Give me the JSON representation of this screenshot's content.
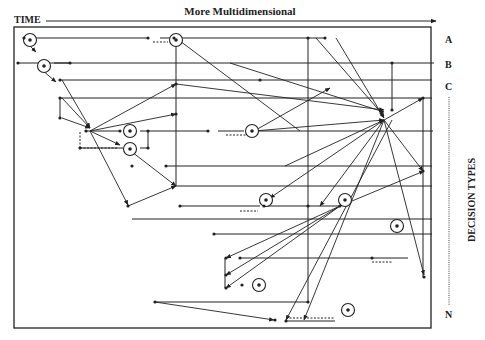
{
  "header": {
    "time_label": "TIME",
    "axis_label": "More Multidimensional"
  },
  "side": {
    "rows": [
      "A",
      "B",
      "C",
      "N"
    ],
    "axis_label": "DECISION TYPES"
  },
  "colors": {
    "ink": "#222222",
    "background": "#ffffff"
  },
  "frame": {
    "x": 14,
    "y": 27,
    "w": 417,
    "h": 301
  },
  "lines": [
    [
      24,
      38,
      148,
      38
    ],
    [
      160,
      38,
      172,
      38
    ],
    [
      180,
      38,
      308,
      38
    ],
    [
      308,
      38,
      325,
      38
    ],
    [
      18,
      63,
      42,
      63
    ],
    [
      48,
      63,
      70,
      63
    ],
    [
      54,
      63,
      434,
      63
    ],
    [
      60,
      80,
      260,
      80
    ],
    [
      260,
      80,
      432,
      80
    ],
    [
      60,
      98,
      432,
      98
    ],
    [
      60,
      98,
      60,
      118
    ],
    [
      86,
      131,
      120,
      131
    ],
    [
      140,
      131,
      208,
      131
    ],
    [
      218,
      131,
      244,
      131
    ],
    [
      254,
      131,
      433,
      131
    ],
    [
      80,
      148,
      123,
      148
    ],
    [
      140,
      148,
      148,
      148
    ],
    [
      148,
      131,
      148,
      148
    ],
    [
      166,
      166,
      432,
      166
    ],
    [
      174,
      186,
      432,
      186
    ],
    [
      180,
      206,
      260,
      206
    ],
    [
      264,
      206,
      340,
      206
    ],
    [
      132,
      219,
      432,
      219
    ],
    [
      214,
      234,
      432,
      234
    ],
    [
      240,
      258,
      408,
      258
    ],
    [
      225,
      258,
      225,
      288
    ],
    [
      155,
      302,
      308,
      302
    ],
    [
      286,
      321,
      335,
      321
    ],
    [
      176,
      38,
      176,
      186
    ],
    [
      308,
      38,
      308,
      302
    ],
    [
      423,
      98,
      423,
      277
    ],
    [
      392,
      63,
      392,
      110
    ]
  ],
  "dashed": [
    [
      153,
      42,
      168,
      42
    ],
    [
      226,
      135,
      248,
      135
    ],
    [
      240,
      211,
      258,
      211
    ],
    [
      372,
      262,
      392,
      262
    ],
    [
      286,
      318,
      335,
      318
    ],
    [
      80,
      148,
      80,
      132
    ],
    [
      80,
      148,
      118,
      148
    ]
  ],
  "arrows": [
    [
      26,
      42,
      36,
      52
    ],
    [
      42,
      70,
      56,
      82
    ],
    [
      62,
      80,
      90,
      128
    ],
    [
      62,
      98,
      90,
      128
    ],
    [
      62,
      118,
      90,
      128
    ],
    [
      90,
      131,
      176,
      84
    ],
    [
      90,
      131,
      176,
      114
    ],
    [
      90,
      131,
      128,
      205
    ],
    [
      90,
      131,
      120,
      145
    ],
    [
      128,
      206,
      176,
      186
    ],
    [
      132,
      152,
      176,
      186
    ],
    [
      300,
      131,
      176,
      38
    ],
    [
      176,
      84,
      384,
      110
    ],
    [
      230,
      63,
      384,
      112
    ],
    [
      316,
      38,
      384,
      116
    ],
    [
      336,
      38,
      384,
      118
    ],
    [
      254,
      131,
      330,
      88
    ],
    [
      254,
      131,
      384,
      120
    ],
    [
      285,
      166,
      384,
      120
    ],
    [
      340,
      206,
      424,
      171
    ],
    [
      384,
      120,
      423,
      98
    ],
    [
      384,
      120,
      423,
      171
    ],
    [
      384,
      120,
      424,
      275
    ],
    [
      392,
      120,
      286,
      320
    ],
    [
      384,
      120,
      320,
      206
    ],
    [
      340,
      206,
      226,
      258
    ],
    [
      340,
      206,
      226,
      275
    ],
    [
      340,
      206,
      226,
      288
    ],
    [
      384,
      120,
      304,
      320
    ],
    [
      155,
      302,
      274,
      320
    ],
    [
      384,
      120,
      270,
      198
    ]
  ],
  "nodes": [
    [
      24,
      38
    ],
    [
      148,
      38
    ],
    [
      174,
      38
    ],
    [
      308,
      38
    ],
    [
      325,
      38
    ],
    [
      18,
      63
    ],
    [
      70,
      63
    ],
    [
      60,
      80
    ],
    [
      60,
      98
    ],
    [
      60,
      118
    ],
    [
      86,
      131
    ],
    [
      120,
      131
    ],
    [
      208,
      131
    ],
    [
      148,
      131
    ],
    [
      80,
      148
    ],
    [
      148,
      148
    ],
    [
      176,
      84
    ],
    [
      176,
      114
    ],
    [
      128,
      206
    ],
    [
      132,
      166
    ],
    [
      166,
      166
    ],
    [
      180,
      206
    ],
    [
      260,
      80
    ],
    [
      392,
      63
    ],
    [
      392,
      110
    ],
    [
      308,
      206
    ],
    [
      226,
      258
    ],
    [
      226,
      275
    ],
    [
      226,
      288
    ],
    [
      240,
      258
    ],
    [
      264,
      206
    ],
    [
      340,
      206
    ],
    [
      423,
      98
    ],
    [
      423,
      171
    ],
    [
      424,
      277
    ],
    [
      214,
      234
    ],
    [
      308,
      302
    ],
    [
      286,
      321
    ],
    [
      242,
      285
    ],
    [
      155,
      302
    ],
    [
      275,
      320
    ],
    [
      372,
      258
    ]
  ],
  "circles": [
    [
      30,
      40
    ],
    [
      44,
      66
    ],
    [
      176,
      40
    ],
    [
      130,
      131
    ],
    [
      130,
      149
    ],
    [
      252,
      131
    ],
    [
      266,
      200
    ],
    [
      345,
      200
    ],
    [
      397,
      226
    ],
    [
      259,
      285
    ],
    [
      348,
      310
    ]
  ]
}
